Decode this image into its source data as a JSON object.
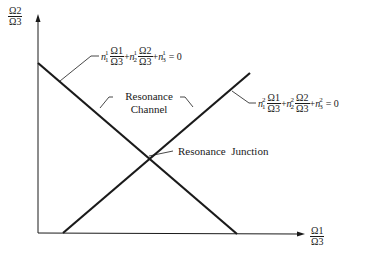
{
  "diagram": {
    "y_axis_label": {
      "num": "Ω2",
      "den": "Ω3"
    },
    "x_axis_label": {
      "num": "Ω1",
      "den": "Ω3"
    },
    "line1_equation": {
      "term1_coef": "n",
      "term1_sup": "1",
      "term1_sub": "1",
      "term1_num": "Ω1",
      "term1_den": "Ω3",
      "term2_coef": "n",
      "term2_sup": "1",
      "term2_sub": "2",
      "term2_num": "Ω2",
      "term2_den": "Ω3",
      "term3_coef": "n",
      "term3_sup": "1",
      "term3_sub": "3",
      "plus": "+",
      "equals": "= 0"
    },
    "line2_equation": {
      "term1_coef": "n",
      "term1_sup": "2",
      "term1_sub": "1",
      "term1_num": "Ω1",
      "term1_den": "Ω3",
      "term2_coef": "n",
      "term2_sup": "2",
      "term2_sub": "2",
      "term2_num": "Ω2",
      "term2_den": "Ω3",
      "term3_coef": "n",
      "term3_sup": "2",
      "term3_sub": "3",
      "plus": "+",
      "equals": "= 0"
    },
    "channel_label_line1": "Resonance",
    "channel_label_line2": "Channel",
    "junction_label": "Resonance  Junction"
  }
}
